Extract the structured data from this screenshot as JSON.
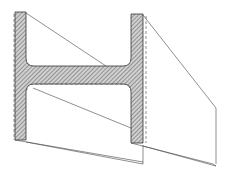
{
  "diagram": {
    "colors": {
      "background": "#ffffff",
      "line": "#333333",
      "hatch": "#555555",
      "fill": "#d8d8d8"
    },
    "labels": []
  }
}
